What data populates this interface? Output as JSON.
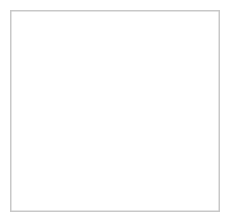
{
  "figure": {
    "style": "hand-drawn pencil sketch",
    "canvas": {
      "width": 230,
      "height": 222
    },
    "colors": {
      "background": "#ffffff",
      "frame_border": "#c8c8c8",
      "ink": "#4a4a4a",
      "ink_light": "#8a8a8a",
      "body_fill": "#f2f2f0",
      "stipple": "#9a9a9a",
      "dark_particle": "#3a3a3a",
      "light_particle_fill": "#fbfbfb"
    },
    "frame": {
      "inset_x": 10,
      "inset_y": 10,
      "width": 210,
      "height": 202,
      "border_width": 1.5
    }
  },
  "panels": [
    {
      "id": "left-cell",
      "label": "untreated cell with light particles and micropipette",
      "center": {
        "x": 70,
        "y": 101
      },
      "body_radius": 28,
      "expression": "neutral",
      "has_eyebrows": false,
      "antenna": {
        "base_x": 70,
        "base_y": 73,
        "tip_x": 68,
        "tip_y": 54,
        "loop_r": 4
      },
      "eyes": [
        {
          "cx": 57,
          "cy": 100,
          "r_outer": 8.5,
          "r_inner": 4,
          "pupil_r": 1.8,
          "pupil_dx": -1.2,
          "pupil_dy": -1.2
        },
        {
          "cx": 80,
          "cy": 100,
          "r_outer": 10.5,
          "r_inner": 5.5,
          "pupil_r": 2.2,
          "pupil_dx": -1.4,
          "pupil_dy": -1.4
        }
      ],
      "legs": 4
    },
    {
      "id": "right-cell",
      "label": "treated cell with angry expression and dark particles",
      "center": {
        "x": 155,
        "y": 103
      },
      "body_radius": 26,
      "expression": "angry",
      "has_eyebrows": true,
      "antenna": {
        "base_x": 155,
        "base_y": 77,
        "tip_x": 154,
        "tip_y": 57,
        "loop_r": 3.6
      },
      "eyes": [
        {
          "cx": 144,
          "cy": 103,
          "r_outer": 8.5,
          "r_inner": 4.4,
          "pupil_r": 2.0,
          "pupil_dx": -1.0,
          "pupil_dy": -1.0
        },
        {
          "cx": 166,
          "cy": 103,
          "r_outer": 8.5,
          "r_inner": 4.4,
          "pupil_r": 2.0,
          "pupil_dx": -1.0,
          "pupil_dy": -1.0
        }
      ],
      "legs": 4
    }
  ],
  "particles": {
    "light": {
      "label": "light outlined particles entering left cell",
      "count": 2,
      "items": [
        {
          "cx": 26,
          "cy": 60,
          "r": 6.2
        },
        {
          "cx": 45,
          "cy": 49,
          "r": 6.8
        }
      ]
    },
    "dark": {
      "label": "dark filled particles near right cell",
      "count": 2,
      "items": [
        {
          "cx": 193,
          "cy": 56,
          "r": 3.6
        },
        {
          "cx": 204,
          "cy": 64,
          "r": 3.2
        }
      ]
    }
  },
  "arrows": [
    {
      "id": "arrow-light-particles",
      "label": "straight arrow from light particles to left cell",
      "kind": "straight",
      "from": {
        "x": 41,
        "y": 62
      },
      "to": {
        "x": 55,
        "y": 78
      }
    },
    {
      "id": "arrow-dark-particles",
      "label": "curved arrow from dark particles to right cell",
      "kind": "curved",
      "from": {
        "x": 198,
        "y": 71
      },
      "to": {
        "x": 180,
        "y": 97
      }
    },
    {
      "id": "arrow-morphology",
      "label": "straight arrow between ellipse groups",
      "kind": "straight",
      "from": {
        "x": 110,
        "y": 181
      },
      "to": {
        "x": 131,
        "y": 181
      }
    },
    {
      "id": "arrow-ellipse-to-cell",
      "label": "upward arrow from ellipses to right cell",
      "kind": "straight",
      "from": {
        "x": 153,
        "y": 160
      },
      "to": {
        "x": 156,
        "y": 136
      }
    }
  ],
  "micropipette": {
    "label": "micropipette needle injecting left cell eye",
    "tip": {
      "x": 81,
      "y": 101
    },
    "entry": {
      "x": 131,
      "y": 21
    },
    "stroke_offset": 3.2
  },
  "morphology": {
    "label": "cell shape change from round to elongated",
    "before": {
      "label": "rounded ellipses",
      "items": [
        {
          "cx": 63,
          "cy": 187,
          "rx": 10.5,
          "ry": 5.6,
          "angle": -32
        },
        {
          "cx": 89,
          "cy": 177,
          "rx": 10.5,
          "ry": 6.2,
          "angle": -28
        }
      ]
    },
    "after": {
      "label": "elongated pointed ellipses",
      "items": [
        {
          "cx": 141,
          "cy": 179,
          "rx": 12.5,
          "ry": 4.6,
          "angle": -48
        },
        {
          "cx": 168,
          "cy": 176,
          "rx": 12.5,
          "ry": 4.4,
          "angle": -52
        }
      ]
    }
  }
}
